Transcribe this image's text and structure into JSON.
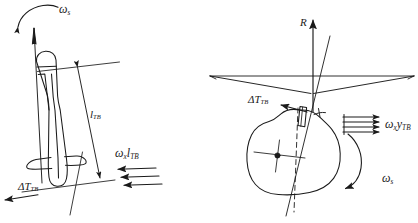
{
  "figure": {
    "title": "",
    "background_color": "#ffffff",
    "stroke_color": "#1a1a1a",
    "width": 418,
    "height": 223
  },
  "left_view": {
    "name": "side-view",
    "labels": {
      "spin_rate": {
        "symbol": "ω",
        "subscript": "s"
      },
      "length": {
        "symbol": "l",
        "subscript": "TB"
      },
      "transverse_velocity": {
        "symbol": "ω",
        "subscript1": "x",
        "symbol2": "l",
        "subscript2": "TB"
      },
      "thrust_misalignment": {
        "symbol": "ΔT",
        "subscript": "TB"
      }
    },
    "arrow_count_transverse": 3
  },
  "right_view": {
    "name": "front-view",
    "labels": {
      "resultant": {
        "symbol": "R",
        "subscript": ""
      },
      "thrust_misalignment": {
        "symbol": "ΔT",
        "subscript": "TB"
      },
      "cross_flow": {
        "symbol": "ω",
        "subscript1": "x",
        "symbol2": "y",
        "subscript2": "TB"
      },
      "spin_rate": {
        "symbol": "ω",
        "subscript": "s"
      }
    },
    "arrow_count_cross_flow": 4
  }
}
